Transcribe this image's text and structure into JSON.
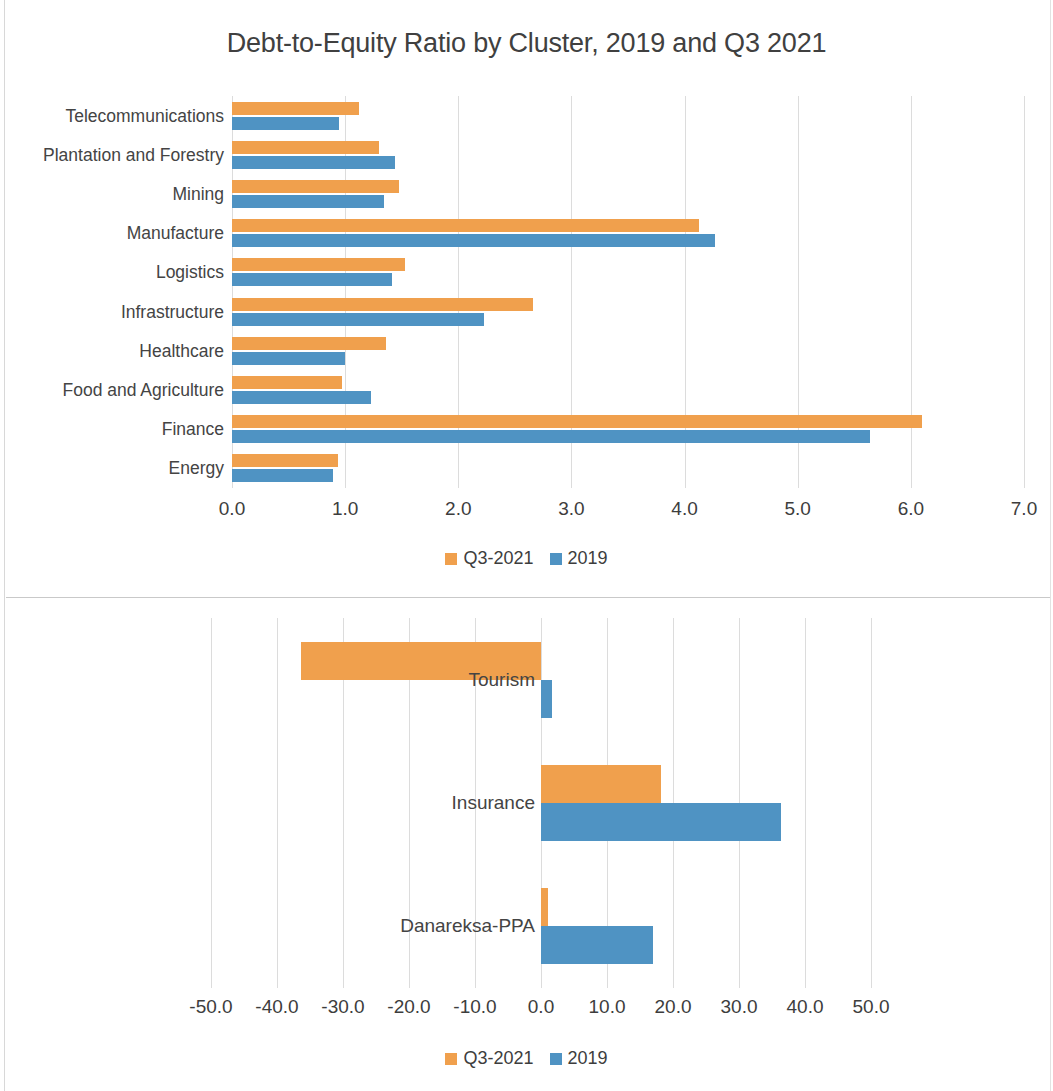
{
  "colors": {
    "series_q3_2021": "#f0a04d",
    "series_2019": "#4f93c3",
    "grid": "#dcdcdc",
    "text": "#404040"
  },
  "top": {
    "title": "Debt-to-Equity Ratio by Cluster, 2019 and Q3 2021",
    "legend": [
      {
        "label": "Q3-2021",
        "color": "#f0a04d"
      },
      {
        "label": "2019",
        "color": "#4f93c3"
      }
    ]
  },
  "bottom": {
    "legend": [
      {
        "label": "Q3-2021",
        "color": "#f0a04d"
      },
      {
        "label": "2019",
        "color": "#4f93c3"
      }
    ]
  },
  "chart_data": [
    {
      "type": "bar",
      "orientation": "horizontal",
      "title": "Debt-to-Equity Ratio by Cluster, 2019 and Q3 2021",
      "xlabel": "",
      "ylabel": "",
      "xlim": [
        0.0,
        7.0
      ],
      "xticks": [
        0.0,
        1.0,
        2.0,
        3.0,
        4.0,
        5.0,
        6.0,
        7.0
      ],
      "xtick_labels": [
        "0.0",
        "1.0",
        "2.0",
        "3.0",
        "4.0",
        "5.0",
        "6.0",
        "7.0"
      ],
      "grid": true,
      "legend_position": "bottom",
      "categories": [
        "Telecommunications",
        "Plantation and Forestry",
        "Mining",
        "Manufacture",
        "Logistics",
        "Infrastructure",
        "Healthcare",
        "Food and Agriculture",
        "Finance",
        "Energy"
      ],
      "series": [
        {
          "name": "Q3-2021",
          "color": "#f0a04d",
          "values": [
            1.12,
            1.3,
            1.48,
            4.13,
            1.53,
            2.66,
            1.36,
            0.97,
            6.1,
            0.94
          ]
        },
        {
          "name": "2019",
          "color": "#4f93c3",
          "values": [
            0.95,
            1.44,
            1.34,
            4.27,
            1.41,
            2.23,
            1.0,
            1.23,
            5.64,
            0.89
          ]
        }
      ]
    },
    {
      "type": "bar",
      "orientation": "horizontal",
      "title": "",
      "xlabel": "",
      "ylabel": "",
      "xlim": [
        -55.0,
        55.0
      ],
      "xticks": [
        -50.0,
        -40.0,
        -30.0,
        -20.0,
        -10.0,
        0.0,
        10.0,
        20.0,
        30.0,
        40.0,
        50.0
      ],
      "xtick_labels": [
        "-50.0",
        "-40.0",
        "-30.0",
        "-20.0",
        "-10.0",
        "0.0",
        "10.0",
        "20.0",
        "30.0",
        "40.0",
        "50.0"
      ],
      "grid": true,
      "legend_position": "bottom",
      "categories": [
        "Tourism",
        "Insurance",
        "Danareksa-PPA"
      ],
      "series": [
        {
          "name": "Q3-2021",
          "color": "#f0a04d",
          "values": [
            -36.3,
            18.2,
            1.1
          ]
        },
        {
          "name": "2019",
          "color": "#4f93c3",
          "values": [
            1.6,
            36.3,
            16.9
          ]
        }
      ]
    }
  ]
}
